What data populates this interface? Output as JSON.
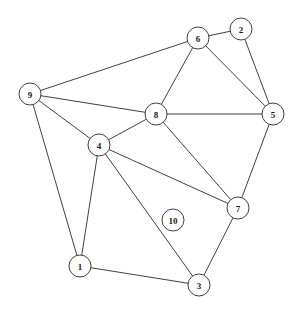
{
  "figure": {
    "kind": "undirected-graph-drawing",
    "width": 299,
    "height": 310,
    "background_color": "#ffffff",
    "node_fill_color": "#ffffff",
    "node_stroke_color": "#2b2b2b",
    "edge_color": "#2b2b2b",
    "label_color": "#1a1a1a",
    "node_radius": 11
  },
  "graph_data": {
    "type": "node-link-diagram",
    "directed": false,
    "node_count": 10,
    "edge_count": 17,
    "nodes": [
      {
        "id": "1",
        "label": "1",
        "x": 80,
        "y": 266,
        "r": 11,
        "degree": 3,
        "isolated": false
      },
      {
        "id": "2",
        "label": "2",
        "x": 241,
        "y": 29,
        "r": 11,
        "degree": 2,
        "isolated": false
      },
      {
        "id": "3",
        "label": "3",
        "x": 199,
        "y": 285,
        "r": 11,
        "degree": 3,
        "isolated": false
      },
      {
        "id": "4",
        "label": "4",
        "x": 99,
        "y": 145,
        "r": 11,
        "degree": 5,
        "isolated": false
      },
      {
        "id": "5",
        "label": "5",
        "x": 273,
        "y": 114,
        "r": 11,
        "degree": 4,
        "isolated": false
      },
      {
        "id": "6",
        "label": "6",
        "x": 198,
        "y": 38,
        "r": 11,
        "degree": 4,
        "isolated": false
      },
      {
        "id": "7",
        "label": "7",
        "x": 238,
        "y": 208,
        "r": 11,
        "degree": 4,
        "isolated": false
      },
      {
        "id": "8",
        "label": "8",
        "x": 156,
        "y": 114,
        "r": 11,
        "degree": 5,
        "isolated": false
      },
      {
        "id": "9",
        "label": "9",
        "x": 30,
        "y": 94,
        "r": 11,
        "degree": 4,
        "isolated": false
      },
      {
        "id": "10",
        "label": "10",
        "x": 173,
        "y": 220,
        "r": 11,
        "degree": 0,
        "isolated": true
      }
    ],
    "edges": [
      {
        "source": "9",
        "target": "6"
      },
      {
        "source": "9",
        "target": "8"
      },
      {
        "source": "9",
        "target": "4"
      },
      {
        "source": "9",
        "target": "1"
      },
      {
        "source": "6",
        "target": "2"
      },
      {
        "source": "6",
        "target": "8"
      },
      {
        "source": "6",
        "target": "5"
      },
      {
        "source": "2",
        "target": "5"
      },
      {
        "source": "8",
        "target": "5"
      },
      {
        "source": "8",
        "target": "4"
      },
      {
        "source": "8",
        "target": "7"
      },
      {
        "source": "5",
        "target": "7"
      },
      {
        "source": "4",
        "target": "1"
      },
      {
        "source": "4",
        "target": "3"
      },
      {
        "source": "4",
        "target": "7"
      },
      {
        "source": "1",
        "target": "3"
      },
      {
        "source": "3",
        "target": "7"
      }
    ]
  }
}
